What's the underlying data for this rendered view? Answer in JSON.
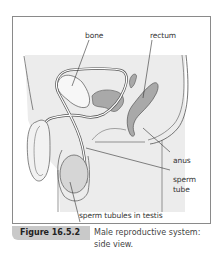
{
  "diagram": {
    "title": "Male reproductive system: side view",
    "labels": {
      "bone": "bone",
      "rectum": "rectum",
      "anus": "anus",
      "sperm_tube_line1": "sperm",
      "sperm_tube_line2": "tube",
      "sperm_tubules": "sperm tubules in testis"
    },
    "colors": {
      "background_shade": "#ececec",
      "organ_fill": "#a9a9a9",
      "outline": "#555555",
      "frame_border": "#8a8a8a",
      "figure_tag_bg": "#c9c9c9"
    }
  },
  "caption": {
    "figure_number": "Figure 16.5.2",
    "line1": "Male reproductive system:",
    "line2": "side view."
  }
}
